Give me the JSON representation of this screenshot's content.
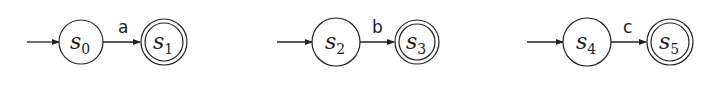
{
  "diagram": {
    "type": "finite-automata",
    "automata": [
      {
        "start": {
          "name": "s",
          "sub": "0",
          "cx": 81,
          "cy": 42
        },
        "accept": {
          "name": "s",
          "sub": "1",
          "cx": 164,
          "cy": 42
        },
        "transition": "a",
        "init_from": 27
      },
      {
        "start": {
          "name": "s",
          "sub": "2",
          "cx": 336,
          "cy": 42
        },
        "accept": {
          "name": "s",
          "sub": "3",
          "cx": 417,
          "cy": 42
        },
        "transition": "b",
        "init_from": 277
      },
      {
        "start": {
          "name": "s",
          "sub": "4",
          "cx": 587,
          "cy": 42
        },
        "accept": {
          "name": "s",
          "sub": "5",
          "cx": 670,
          "cy": 42
        },
        "transition": "c",
        "init_from": 527
      }
    ]
  }
}
